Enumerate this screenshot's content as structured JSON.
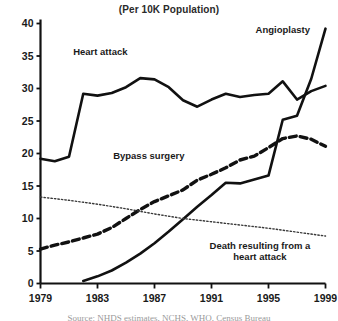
{
  "chart_data": {
    "type": "line",
    "title": "(Per 10K Population)",
    "xlabel": "",
    "ylabel": "",
    "xlim": [
      1979,
      1999
    ],
    "ylim": [
      0,
      40
    ],
    "xticks": [
      1979,
      1983,
      1987,
      1991,
      1995,
      1999
    ],
    "yticks": [
      0,
      5,
      10,
      15,
      20,
      25,
      30,
      35,
      40
    ],
    "grid": false,
    "legend_position": "inline-annotations",
    "series": [
      {
        "name": "Heart attack",
        "style": "solid-thick",
        "x": [
          1979,
          1980,
          1981,
          1982,
          1983,
          1984,
          1985,
          1986,
          1987,
          1988,
          1989,
          1990,
          1991,
          1992,
          1993,
          1994,
          1995,
          1996,
          1997,
          1998,
          1999
        ],
        "values": [
          19.2,
          18.8,
          19.5,
          29.2,
          28.9,
          29.3,
          30.2,
          31.6,
          31.4,
          30.2,
          28.2,
          27.2,
          28.3,
          29.2,
          28.7,
          29.0,
          29.2,
          31.1,
          28.3,
          29.6,
          30.4
        ]
      },
      {
        "name": "Bypass surgery",
        "style": "dashed-thick",
        "x": [
          1979,
          1980,
          1981,
          1982,
          1983,
          1984,
          1985,
          1986,
          1987,
          1988,
          1989,
          1990,
          1991,
          1992,
          1993,
          1994,
          1995,
          1996,
          1997,
          1998,
          1999
        ],
        "values": [
          5.3,
          5.9,
          6.4,
          7.0,
          7.6,
          8.6,
          10.0,
          11.4,
          12.6,
          13.5,
          14.4,
          15.9,
          16.8,
          17.8,
          19.0,
          19.6,
          20.9,
          22.3,
          22.7,
          22.2,
          21.1
        ]
      },
      {
        "name": "Angioplasty",
        "style": "solid-thick",
        "x": [
          1982,
          1983,
          1984,
          1985,
          1986,
          1987,
          1988,
          1989,
          1990,
          1991,
          1992,
          1993,
          1994,
          1995,
          1996,
          1997,
          1998,
          1999
        ],
        "values": [
          0.4,
          1.1,
          2.0,
          3.2,
          4.6,
          6.2,
          8.0,
          9.9,
          11.8,
          13.6,
          15.5,
          15.4,
          16.0,
          16.6,
          25.2,
          25.8,
          31.5,
          39.2
        ]
      },
      {
        "name": "Death resulting from a heart attack",
        "style": "dotted-thin",
        "x": [
          1979,
          1981,
          1983,
          1985,
          1987,
          1989,
          1991,
          1993,
          1995,
          1997,
          1999
        ],
        "values": [
          13.3,
          12.8,
          12.2,
          11.5,
          10.7,
          10.0,
          9.5,
          9.0,
          8.5,
          7.9,
          7.3
        ]
      }
    ],
    "annotations": [
      {
        "id": "heart-attack",
        "text": "Heart attack",
        "x": 1983.2,
        "y": 35.2
      },
      {
        "id": "angioplasty",
        "text": "Angioplasty",
        "x": 1996.0,
        "y": 38.6
      },
      {
        "id": "bypass-surgery",
        "text": "Bypass surgery",
        "x": 1986.6,
        "y": 19.2
      },
      {
        "id": "death-line1",
        "text": "Death resulting from a",
        "x": 1994.4,
        "y": 5.3
      },
      {
        "id": "death-line2",
        "text": "heart attack",
        "x": 1994.4,
        "y": 3.6
      }
    ],
    "colors": {
      "ink": "#111111",
      "title": "#2a2a2a",
      "background": "#ffffff",
      "dotted": "#3a3a3a"
    }
  },
  "source_note": {
    "text": "Source: NHDS estimates, NCHS, WHO, Census Bureau"
  }
}
